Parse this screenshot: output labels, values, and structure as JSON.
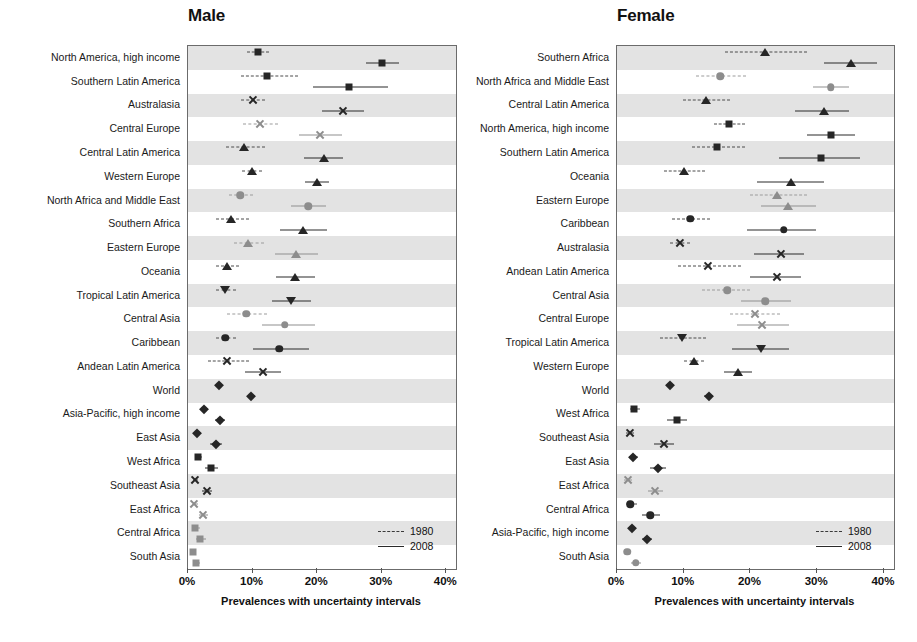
{
  "figure": {
    "axis_title": "Prevalences with uncertainty intervals",
    "legend": {
      "old_label": "1980",
      "new_label": "2008"
    },
    "tick_labels": [
      "0%",
      "10%",
      "20%",
      "30%",
      "40%"
    ],
    "tick_values": [
      0,
      10,
      20,
      30,
      40
    ],
    "colors": {
      "dark": "#262626",
      "light": "#8d8d8d",
      "band": "#e3e3e3",
      "frame": "#6b6b6b"
    }
  },
  "panels": [
    {
      "id": "male",
      "title": "Male"
    },
    {
      "id": "female",
      "title": "Female"
    }
  ],
  "chart_data": {
    "type": "scatter",
    "title": "",
    "subtitle": "",
    "xlabel": "Prevalences with uncertainty intervals",
    "ylabel": "",
    "xlim": [
      0,
      41.5
    ],
    "xticks": [
      0,
      10,
      20,
      30,
      40
    ],
    "xticklabels": [
      "0%",
      "10%",
      "20%",
      "30%",
      "40%"
    ],
    "grid": false,
    "legend": [
      "1980",
      "2008"
    ],
    "legend_position": "bottom-right inside plot",
    "note": "Forest-style dot plot of obesity prevalence by region and sex, 1980 vs 2008, with uncertainty intervals. Values are percent.",
    "panels": [
      {
        "name": "Male",
        "rows": [
          {
            "label": "North America, high income",
            "marker": "square",
            "shade": "dark",
            "y1980": {
              "mean": 10.8,
              "low": 9.2,
              "high": 12.5
            },
            "y2008": {
              "mean": 30.0,
              "low": 27.6,
              "high": 32.6
            }
          },
          {
            "label": "Southern Latin America",
            "marker": "square",
            "shade": "dark",
            "y1980": {
              "mean": 12.3,
              "low": 8.2,
              "high": 17.0
            },
            "y2008": {
              "mean": 24.9,
              "low": 19.3,
              "high": 30.9
            }
          },
          {
            "label": "Australasia",
            "marker": "x",
            "shade": "dark",
            "y1980": {
              "mean": 10.0,
              "low": 8.2,
              "high": 11.9
            },
            "y2008": {
              "mean": 24.0,
              "low": 20.7,
              "high": 27.3
            }
          },
          {
            "label": "Central Europe",
            "marker": "x",
            "shade": "light",
            "y1980": {
              "mean": 11.1,
              "low": 8.5,
              "high": 13.9
            },
            "y2008": {
              "mean": 20.4,
              "low": 17.2,
              "high": 23.8
            }
          },
          {
            "label": "Central Latin America",
            "marker": "triangle",
            "shade": "dark",
            "y1980": {
              "mean": 8.7,
              "low": 5.9,
              "high": 12.0
            },
            "y2008": {
              "mean": 21.0,
              "low": 18.0,
              "high": 24.0
            }
          },
          {
            "label": "Western Europe",
            "marker": "triangle",
            "shade": "dark",
            "y1980": {
              "mean": 9.9,
              "low": 8.4,
              "high": 11.5
            },
            "y2008": {
              "mean": 19.9,
              "low": 18.1,
              "high": 21.8
            }
          },
          {
            "label": "North Africa and Middle East",
            "marker": "circle",
            "shade": "light",
            "y1980": {
              "mean": 8.1,
              "low": 6.3,
              "high": 10.1
            },
            "y2008": {
              "mean": 18.6,
              "low": 16.0,
              "high": 21.3
            }
          },
          {
            "label": "Southern Africa",
            "marker": "triangle",
            "shade": "dark",
            "y1980": {
              "mean": 6.6,
              "low": 4.3,
              "high": 9.4
            },
            "y2008": {
              "mean": 17.8,
              "low": 14.3,
              "high": 21.5
            }
          },
          {
            "label": "Eastern Europe",
            "marker": "triangle",
            "shade": "light",
            "y1980": {
              "mean": 9.3,
              "low": 7.2,
              "high": 11.8
            },
            "y2008": {
              "mean": 16.7,
              "low": 13.4,
              "high": 20.2
            }
          },
          {
            "label": "Oceania",
            "marker": "triangle",
            "shade": "dark",
            "y1980": {
              "mean": 6.0,
              "low": 4.4,
              "high": 7.9
            },
            "y2008": {
              "mean": 16.6,
              "low": 13.7,
              "high": 19.6
            }
          },
          {
            "label": "Tropical Latin America",
            "marker": "itriangle",
            "shade": "dark",
            "y1980": {
              "mean": 5.8,
              "low": 4.3,
              "high": 7.4
            },
            "y2008": {
              "mean": 16.0,
              "low": 13.0,
              "high": 19.0
            }
          },
          {
            "label": "Central Asia",
            "marker": "circle",
            "shade": "light",
            "y1980": {
              "mean": 9.0,
              "low": 6.0,
              "high": 12.3
            },
            "y2008": {
              "mean": 15.0,
              "low": 11.5,
              "high": 19.7
            }
          },
          {
            "label": "Caribbean",
            "marker": "circle",
            "shade": "dark",
            "y1980": {
              "mean": 5.8,
              "low": 4.3,
              "high": 7.5
            },
            "y2008": {
              "mean": 14.1,
              "low": 10.1,
              "high": 18.8
            }
          },
          {
            "label": "Andean Latin America",
            "marker": "x",
            "shade": "dark",
            "y1980": {
              "mean": 6.0,
              "low": 3.1,
              "high": 9.5
            },
            "y2008": {
              "mean": 11.6,
              "low": 8.9,
              "high": 14.4
            }
          },
          {
            "label": "World",
            "marker": "diamond",
            "shade": "dark",
            "y1980": {
              "mean": 4.8,
              "low": 4.4,
              "high": 5.2
            },
            "y2008": {
              "mean": 9.8,
              "low": 9.3,
              "high": 10.3
            }
          },
          {
            "label": "Asia-Pacific, high income",
            "marker": "diamond",
            "shade": "dark",
            "y1980": {
              "mean": 2.5,
              "low": 2.0,
              "high": 3.1
            },
            "y2008": {
              "mean": 4.9,
              "low": 4.2,
              "high": 5.7
            }
          },
          {
            "label": "East Asia",
            "marker": "diamond",
            "shade": "dark",
            "y1980": {
              "mean": 1.4,
              "low": 1.0,
              "high": 2.0
            },
            "y2008": {
              "mean": 4.3,
              "low": 3.4,
              "high": 5.2
            }
          },
          {
            "label": "West Africa",
            "marker": "square",
            "shade": "dark",
            "y1980": {
              "mean": 1.6,
              "low": 1.1,
              "high": 2.2
            },
            "y2008": {
              "mean": 3.6,
              "low": 2.7,
              "high": 4.6
            }
          },
          {
            "label": "Southeast Asia",
            "marker": "x",
            "shade": "dark",
            "y1980": {
              "mean": 1.1,
              "low": 0.7,
              "high": 1.6
            },
            "y2008": {
              "mean": 2.9,
              "low": 2.2,
              "high": 3.7
            }
          },
          {
            "label": "East Africa",
            "marker": "x",
            "shade": "light",
            "y1980": {
              "mean": 1.0,
              "low": 0.7,
              "high": 1.5
            },
            "y2008": {
              "mean": 2.3,
              "low": 1.7,
              "high": 3.1
            }
          },
          {
            "label": "Central Africa",
            "marker": "square",
            "shade": "light",
            "y1980": {
              "mean": 1.1,
              "low": 0.6,
              "high": 1.8
            },
            "y2008": {
              "mean": 1.9,
              "low": 1.2,
              "high": 2.8
            }
          },
          {
            "label": "South Asia",
            "marker": "square",
            "shade": "light",
            "y1980": {
              "mean": 0.8,
              "low": 0.5,
              "high": 1.2
            },
            "y2008": {
              "mean": 1.3,
              "low": 0.9,
              "high": 1.8
            }
          }
        ]
      },
      {
        "name": "Female",
        "rows": [
          {
            "label": "Southern Africa",
            "marker": "triangle",
            "shade": "dark",
            "y1980": {
              "mean": 22.1,
              "low": 16.2,
              "high": 28.5
            },
            "y2008": {
              "mean": 35.0,
              "low": 31.0,
              "high": 39.0
            }
          },
          {
            "label": "North Africa and Middle East",
            "marker": "circle",
            "shade": "light",
            "y1980": {
              "mean": 15.5,
              "low": 11.9,
              "high": 19.3
            },
            "y2008": {
              "mean": 32.0,
              "low": 29.3,
              "high": 34.7
            }
          },
          {
            "label": "Central Latin America",
            "marker": "triangle",
            "shade": "dark",
            "y1980": {
              "mean": 13.3,
              "low": 9.9,
              "high": 17.0
            },
            "y2008": {
              "mean": 31.0,
              "low": 26.6,
              "high": 34.7
            }
          },
          {
            "label": "North America, high income",
            "marker": "square",
            "shade": "dark",
            "y1980": {
              "mean": 16.8,
              "low": 14.5,
              "high": 19.2
            },
            "y2008": {
              "mean": 32.1,
              "low": 28.5,
              "high": 35.7
            }
          },
          {
            "label": "Southern Latin America",
            "marker": "square",
            "shade": "dark",
            "y1980": {
              "mean": 15.0,
              "low": 11.2,
              "high": 19.2
            },
            "y2008": {
              "mean": 30.6,
              "low": 24.2,
              "high": 36.4
            }
          },
          {
            "label": "Oceania",
            "marker": "triangle",
            "shade": "dark",
            "y1980": {
              "mean": 10.0,
              "low": 7.0,
              "high": 13.2
            },
            "y2008": {
              "mean": 26.0,
              "low": 21.0,
              "high": 31.0
            }
          },
          {
            "label": "Eastern Europe",
            "marker": "triangle",
            "shade": "light",
            "y1980": {
              "mean": 24.0,
              "low": 20.0,
              "high": 28.4
            },
            "y2008": {
              "mean": 25.6,
              "low": 21.6,
              "high": 29.8
            }
          },
          {
            "label": "Caribbean",
            "marker": "circle",
            "shade": "dark",
            "y1980": {
              "mean": 11.0,
              "low": 8.3,
              "high": 14.0
            },
            "y2008": {
              "mean": 25.0,
              "low": 19.5,
              "high": 29.8
            }
          },
          {
            "label": "Australasia",
            "marker": "x",
            "shade": "dark",
            "y1980": {
              "mean": 9.4,
              "low": 7.9,
              "high": 11.0
            },
            "y2008": {
              "mean": 24.5,
              "low": 20.5,
              "high": 28.0
            }
          },
          {
            "label": "Andean Latin America",
            "marker": "x",
            "shade": "dark",
            "y1980": {
              "mean": 13.6,
              "low": 9.2,
              "high": 18.6
            },
            "y2008": {
              "mean": 24.0,
              "low": 20.0,
              "high": 27.5
            }
          },
          {
            "label": "Central Asia",
            "marker": "circle",
            "shade": "light",
            "y1980": {
              "mean": 16.5,
              "low": 12.7,
              "high": 20.0
            },
            "y2008": {
              "mean": 22.2,
              "low": 18.6,
              "high": 26.0
            }
          },
          {
            "label": "Central Europe",
            "marker": "x",
            "shade": "light",
            "y1980": {
              "mean": 20.7,
              "low": 17.0,
              "high": 24.4
            },
            "y2008": {
              "mean": 21.7,
              "low": 18.0,
              "high": 25.7
            }
          },
          {
            "label": "Tropical Latin America",
            "marker": "itriangle",
            "shade": "dark",
            "y1980": {
              "mean": 9.8,
              "low": 6.5,
              "high": 13.4
            },
            "y2008": {
              "mean": 21.6,
              "low": 17.3,
              "high": 25.8
            }
          },
          {
            "label": "Western Europe",
            "marker": "triangle",
            "shade": "dark",
            "y1980": {
              "mean": 11.5,
              "low": 10.0,
              "high": 13.1
            },
            "y2008": {
              "mean": 18.2,
              "low": 16.1,
              "high": 20.3
            }
          },
          {
            "label": "World",
            "marker": "diamond",
            "shade": "dark",
            "y1980": {
              "mean": 7.9,
              "low": 7.3,
              "high": 8.5
            },
            "y2008": {
              "mean": 13.8,
              "low": 13.1,
              "high": 14.4
            }
          },
          {
            "label": "West Africa",
            "marker": "square",
            "shade": "dark",
            "y1980": {
              "mean": 2.6,
              "low": 1.9,
              "high": 3.4
            },
            "y2008": {
              "mean": 9.0,
              "low": 7.5,
              "high": 10.5
            }
          },
          {
            "label": "Southeast Asia",
            "marker": "x",
            "shade": "dark",
            "y1980": {
              "mean": 1.9,
              "low": 1.3,
              "high": 2.5
            },
            "y2008": {
              "mean": 7.0,
              "low": 5.6,
              "high": 8.5
            }
          },
          {
            "label": "East Asia",
            "marker": "diamond",
            "shade": "dark",
            "y1980": {
              "mean": 2.4,
              "low": 1.8,
              "high": 3.1
            },
            "y2008": {
              "mean": 6.2,
              "low": 5.0,
              "high": 7.4
            }
          },
          {
            "label": "East Africa",
            "marker": "x",
            "shade": "light",
            "y1980": {
              "mean": 1.6,
              "low": 1.1,
              "high": 2.2
            },
            "y2008": {
              "mean": 5.7,
              "low": 4.6,
              "high": 6.9
            }
          },
          {
            "label": "Central Africa",
            "marker": "circle",
            "shade": "dark",
            "y1980": {
              "mean": 2.0,
              "low": 1.4,
              "high": 3.0
            },
            "y2008": {
              "mean": 5.0,
              "low": 3.7,
              "high": 6.5
            }
          },
          {
            "label": "Asia-Pacific, high income",
            "marker": "diamond",
            "shade": "dark",
            "y1980": {
              "mean": 2.3,
              "low": 1.8,
              "high": 2.9
            },
            "y2008": {
              "mean": 4.5,
              "low": 3.8,
              "high": 5.3
            }
          },
          {
            "label": "South Asia",
            "marker": "circle",
            "shade": "light",
            "y1980": {
              "mean": 1.5,
              "low": 1.0,
              "high": 2.1
            },
            "y2008": {
              "mean": 2.8,
              "low": 2.1,
              "high": 3.6
            }
          }
        ]
      }
    ]
  }
}
